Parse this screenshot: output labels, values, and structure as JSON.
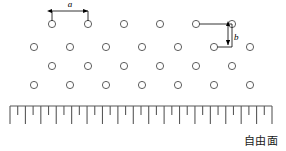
{
  "figure": {
    "caption_free_surface": "自由面",
    "labels": {
      "a": "a",
      "b": "b"
    },
    "colors": {
      "circle_stroke": "#4d4d4d",
      "line": "#000000",
      "ruler": "#595959",
      "text": "#1a1a1a",
      "background": "#ffffff"
    }
  },
  "lattice": {
    "circle_radius": 3.6,
    "rows": [
      {
        "y": 24,
        "cx": [
          52,
          88,
          124,
          160,
          196,
          232
        ]
      },
      {
        "y": 47,
        "cx": [
          34,
          70,
          106,
          142,
          178,
          214,
          250
        ]
      },
      {
        "y": 66,
        "cx": [
          52,
          88,
          124,
          160,
          196,
          232
        ]
      },
      {
        "y": 85,
        "cx": [
          34,
          70,
          106,
          142,
          178,
          214,
          250
        ]
      }
    ]
  },
  "dimension_a": {
    "label": "a",
    "x_start": 52,
    "x_end": 88,
    "y_arrow": 11,
    "label_x": 70,
    "label_y": 7,
    "tick_bottom": 21
  },
  "dimension_b": {
    "label": "b",
    "x_left_circle": 196,
    "x_right_circle": 232,
    "y_top": 24,
    "y_bottom": 47,
    "x_arrow": 228,
    "label_x": 234,
    "label_y": 40,
    "x_lower_circle": 214
  },
  "ruler": {
    "x_start": 10,
    "x_end": 272,
    "y_baseline": 106,
    "tick_long": 18,
    "tick_short": 9,
    "tick_count": 35,
    "tick_spacing": 7.7
  }
}
